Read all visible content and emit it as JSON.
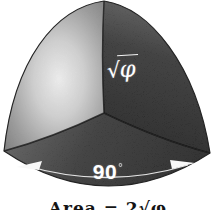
{
  "figure": {
    "labels": {
      "edge_radical": "√",
      "edge_symbol": "φ",
      "arc_value": "90",
      "arc_degree": "°"
    },
    "caption": "Area = 2√φ",
    "colors": {
      "background": "#ffffff",
      "left_face_highlight": "#f4f4f4",
      "left_face_shadow": "#5e5e5e",
      "right_face_dark": "#161616",
      "bottom_face": "#2a2a2a",
      "annotation": "#ffffff",
      "caption_text": "#141414"
    }
  }
}
